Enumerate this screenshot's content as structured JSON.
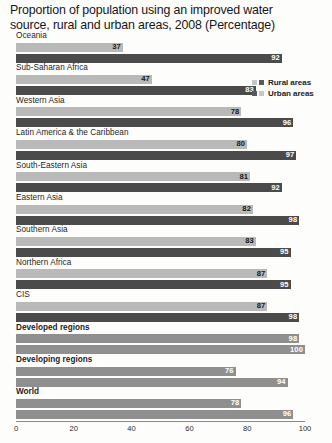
{
  "chart_data": {
    "type": "bar",
    "orientation": "horizontal",
    "title": "Proportion of population using an improved water source, rural and urban areas, 2008 (Percentage)",
    "xlabel": "",
    "ylabel": "",
    "xlim": [
      0,
      100
    ],
    "xticks": [
      "0",
      "20",
      "40",
      "60",
      "80",
      "100"
    ],
    "grid": false,
    "legend_position": "top-right",
    "legend": [
      "Rural areas",
      "Urban areas"
    ],
    "categories": [
      "Oceania",
      "Sub-Saharan Africa",
      "Western Asia",
      "Latin America & the Caribbean",
      "South-Eastern Asia",
      "Eastern Asia",
      "Southern Asia",
      "Northern Africa",
      "CIS",
      "Developed regions",
      "Developing regions",
      "World"
    ],
    "series": [
      {
        "name": "Rural areas",
        "values": [
          37,
          47,
          78,
          80,
          81,
          82,
          83,
          87,
          87,
          98,
          76,
          78
        ]
      },
      {
        "name": "Urban areas",
        "values": [
          92,
          83,
          96,
          97,
          92,
          98,
          95,
          95,
          98,
          100,
          94,
          96
        ]
      }
    ],
    "value_labels": {
      "Oceania": {
        "rural": "37",
        "urban": "92"
      },
      "Sub-Saharan Africa": {
        "rural": "47",
        "urban": "83"
      },
      "Western Asia": {
        "rural": "78",
        "urban": "96"
      },
      "Latin America & the Caribbean": {
        "rural": "80",
        "urban": "97"
      },
      "South-Eastern Asia": {
        "rural": "81",
        "urban": "92"
      },
      "Eastern Asia": {
        "rural": "82",
        "urban": "98"
      },
      "Southern Asia": {
        "rural": "83",
        "urban": "95"
      },
      "Northern Africa": {
        "rural": "87",
        "urban": "95"
      },
      "CIS": {
        "rural": "87",
        "urban": "98"
      },
      "Developed regions": {
        "rural": "98",
        "urban": "100"
      },
      "Developing regions": {
        "rural": "76",
        "urban": "94"
      },
      "World": {
        "rural": "78",
        "urban": "96"
      }
    },
    "emphasized_categories": [
      "Developed regions",
      "Developing regions",
      "World"
    ],
    "colors": {
      "rural": "#b9b9b9",
      "urban": "#4b4b4b",
      "aggregate": "#8f8f8f",
      "axis": "#8a8a8a",
      "text": "#1b1b1b",
      "background": "#fdfdfc"
    }
  },
  "groups": [
    {
      "label": "Oceania",
      "rural": 37,
      "urban": 92,
      "rural_label": "37",
      "urban_label": "92",
      "bold": false,
      "flat": false
    },
    {
      "label": "Sub-Saharan Africa",
      "rural": 47,
      "urban": 83,
      "rural_label": "47",
      "urban_label": "83",
      "bold": false,
      "flat": false
    },
    {
      "label": "Western Asia",
      "rural": 78,
      "urban": 96,
      "rural_label": "78",
      "urban_label": "96",
      "bold": false,
      "flat": false
    },
    {
      "label": "Latin America & the Caribbean",
      "rural": 80,
      "urban": 97,
      "rural_label": "80",
      "urban_label": "97",
      "bold": false,
      "flat": false
    },
    {
      "label": "South-Eastern Asia",
      "rural": 81,
      "urban": 92,
      "rural_label": "81",
      "urban_label": "92",
      "bold": false,
      "flat": false
    },
    {
      "label": "Eastern Asia",
      "rural": 82,
      "urban": 98,
      "rural_label": "82",
      "urban_label": "98",
      "bold": false,
      "flat": false
    },
    {
      "label": "Southern Asia",
      "rural": 83,
      "urban": 95,
      "rural_label": "83",
      "urban_label": "95",
      "bold": false,
      "flat": false
    },
    {
      "label": "Northern Africa",
      "rural": 87,
      "urban": 95,
      "rural_label": "87",
      "urban_label": "95",
      "bold": false,
      "flat": false
    },
    {
      "label": "CIS",
      "rural": 87,
      "urban": 98,
      "rural_label": "87",
      "urban_label": "98",
      "bold": false,
      "flat": false
    },
    {
      "label": "Developed regions",
      "rural": 98,
      "urban": 100,
      "rural_label": "98",
      "urban_label": "100",
      "bold": true,
      "flat": true
    },
    {
      "label": "Developing regions",
      "rural": 76,
      "urban": 94,
      "rural_label": "76",
      "urban_label": "94",
      "bold": true,
      "flat": true
    },
    {
      "label": "World",
      "rural": 78,
      "urban": 96,
      "rural_label": "78",
      "urban_label": "96",
      "bold": true,
      "flat": true
    }
  ],
  "legend": {
    "rows": [
      {
        "label": "Rural areas"
      },
      {
        "label": "Urban areas"
      }
    ]
  },
  "axis": {
    "ticks": [
      {
        "label": "0",
        "value": 0
      },
      {
        "label": "20",
        "value": 20
      },
      {
        "label": "40",
        "value": 40
      },
      {
        "label": "60",
        "value": 60
      },
      {
        "label": "80",
        "value": 80
      },
      {
        "label": "100",
        "value": 100
      }
    ]
  },
  "title": "Proportion of population using an improved water\nsource, rural and urban areas, 2008 (Percentage)"
}
